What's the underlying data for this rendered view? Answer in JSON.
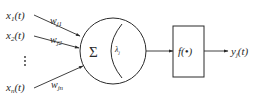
{
  "diagram": {
    "inputs": [
      {
        "var": "x",
        "sub": "1",
        "arg": "(t)",
        "weight_var": "w",
        "weight_sub": "j1"
      },
      {
        "var": "x",
        "sub": "2",
        "arg": "(t)",
        "weight_var": "w",
        "weight_sub": "j2"
      },
      {
        "var": "x",
        "sub": "n",
        "arg": "(t)",
        "weight_var": "w",
        "weight_sub": "jn"
      }
    ],
    "ellipsis": "⋮",
    "neuron": {
      "sum_symbol": "Σ",
      "threshold_var": "λ",
      "threshold_sub": "j"
    },
    "activation": {
      "label": "f(•)"
    },
    "output": {
      "var": "y",
      "sub": "j",
      "arg": "(t)"
    },
    "colors": {
      "stroke": "#2a2a2a",
      "background": "#ffffff"
    }
  }
}
